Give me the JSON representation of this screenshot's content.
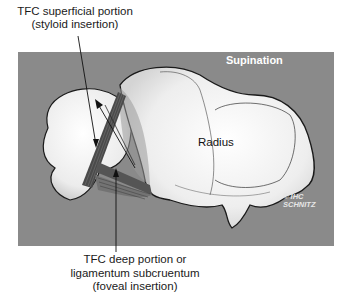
{
  "figure": {
    "panel_title": "Supination",
    "bone_label": "Radius",
    "copyright_line1": "© IHC",
    "copyright_line2": "SCHNITZ",
    "callout_top": {
      "line1": "TFC superficial portion",
      "line2": "(styloid insertion)"
    },
    "callout_bottom": {
      "line1": "TFC deep portion or",
      "line2": "ligamentum subcruentum",
      "line3": "(foveal insertion)"
    }
  },
  "colors": {
    "panel_background": "#8a8a8a",
    "bone_fill": "#f2f2f2",
    "ligament": "#4a4a4a",
    "outline": "#1a1a1a",
    "panel_text": "#ffffff"
  }
}
